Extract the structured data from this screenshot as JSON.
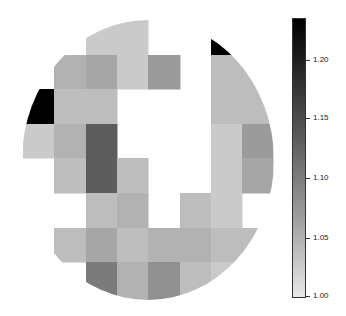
{
  "chart_data": {
    "type": "heatmap",
    "title": "",
    "xlabel": "",
    "ylabel": "",
    "shape": "circular mask (ellipse)",
    "grid": {
      "rows": 8,
      "cols": 8
    },
    "colormap": "gray_r",
    "colorbar": {
      "min": 1.0,
      "max": 1.22,
      "ticks": [
        1.0,
        1.05,
        1.1,
        1.15,
        1.2
      ],
      "tick_labels": [
        "1.00",
        "1.05",
        "1.10",
        "1.15",
        "1.20"
      ]
    },
    "values": [
      [
        null,
        null,
        1.02,
        1.02,
        null,
        null,
        1.22,
        1.05
      ],
      [
        null,
        1.04,
        1.05,
        1.02,
        1.06,
        null,
        1.03,
        1.03
      ],
      [
        1.22,
        1.03,
        1.03,
        null,
        null,
        null,
        1.03,
        1.03
      ],
      [
        1.02,
        1.04,
        1.12,
        null,
        null,
        null,
        1.02,
        1.06
      ],
      [
        null,
        1.03,
        1.12,
        1.03,
        null,
        null,
        1.02,
        1.05
      ],
      [
        null,
        null,
        1.03,
        1.04,
        null,
        1.03,
        1.02,
        null
      ],
      [
        null,
        1.03,
        1.05,
        1.03,
        1.04,
        1.04,
        1.03,
        1.03
      ],
      [
        null,
        null,
        1.09,
        1.04,
        1.07,
        1.03,
        1.02,
        null
      ]
    ]
  },
  "colorbar_labels": {
    "t0": "1.20",
    "t1": "1.15",
    "t2": "1.10",
    "t3": "1.05",
    "t4": "1.00"
  }
}
